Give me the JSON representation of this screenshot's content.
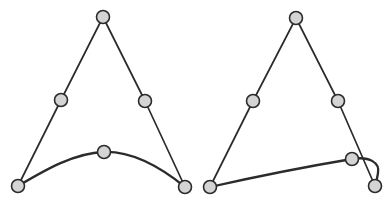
{
  "figure": {
    "background_color": "#ffffff",
    "stroke_color": "#2b2b2b",
    "node_fill_color": "#d4d4d4",
    "node_radius": 6.5,
    "panels": [
      {
        "id": "left-panel",
        "label": "Symmetric arc case",
        "control_polygon": {
          "label": "control-polygon-left",
          "path": "M 18,186 L 61,100 L 103,17 L 145,101 L 185,187",
          "vertices": [
            {
              "name": "p0",
              "x": 18,
              "y": 186
            },
            {
              "name": "p1",
              "x": 61,
              "y": 100
            },
            {
              "name": "p2",
              "x": 103,
              "y": 17
            },
            {
              "name": "p3",
              "x": 145,
              "y": 101
            },
            {
              "name": "p4",
              "x": 185,
              "y": 187
            }
          ]
        },
        "curve": {
          "label": "spline-curve-left",
          "path": "M 18,186 C 45,170 74,153 104,152 C 134,151 164,170 185,187",
          "endpoints": [
            {
              "name": "curve-start",
              "x": 18,
              "y": 186
            },
            {
              "name": "curve-end",
              "x": 185,
              "y": 187
            }
          ],
          "midpoint": {
            "name": "curve-mid",
            "x": 104,
            "y": 152
          }
        },
        "nodes": [
          {
            "name": "node-left-base-left",
            "x": 18,
            "y": 186
          },
          {
            "name": "node-left-mid-left",
            "x": 61,
            "y": 100
          },
          {
            "name": "node-left-apex",
            "x": 103,
            "y": 17
          },
          {
            "name": "node-left-mid-right",
            "x": 145,
            "y": 101
          },
          {
            "name": "node-left-curve-mid",
            "x": 104,
            "y": 152
          },
          {
            "name": "node-left-base-right",
            "x": 185,
            "y": 187
          }
        ]
      },
      {
        "id": "right-panel",
        "label": "Asymmetric looped case",
        "control_polygon": {
          "label": "control-polygon-right",
          "path": "M 210,187 L 253,101 L 296,18 L 338,101 L 375,186",
          "vertices": [
            {
              "name": "p0",
              "x": 210,
              "y": 187
            },
            {
              "name": "p1",
              "x": 253,
              "y": 101
            },
            {
              "name": "p2",
              "x": 296,
              "y": 18
            },
            {
              "name": "p3",
              "x": 338,
              "y": 101
            },
            {
              "name": "p4",
              "x": 375,
              "y": 186
            }
          ]
        },
        "curve": {
          "label": "spline-curve-right",
          "path": "M 210,187 C 250,178 310,166 352,159 C 370,156 380,163 378,173 C 377,180 376,183 375,186",
          "endpoints": [
            {
              "name": "curve-start",
              "x": 210,
              "y": 187
            },
            {
              "name": "curve-end",
              "x": 375,
              "y": 186
            }
          ],
          "midpoint": {
            "name": "curve-mid",
            "x": 352,
            "y": 159
          }
        },
        "nodes": [
          {
            "name": "node-right-base-left",
            "x": 210,
            "y": 187
          },
          {
            "name": "node-right-mid-left",
            "x": 253,
            "y": 101
          },
          {
            "name": "node-right-apex",
            "x": 296,
            "y": 18
          },
          {
            "name": "node-right-mid-right",
            "x": 338,
            "y": 101
          },
          {
            "name": "node-right-curve-mid",
            "x": 352,
            "y": 159
          },
          {
            "name": "node-right-base-right",
            "x": 375,
            "y": 186
          }
        ]
      }
    ]
  }
}
